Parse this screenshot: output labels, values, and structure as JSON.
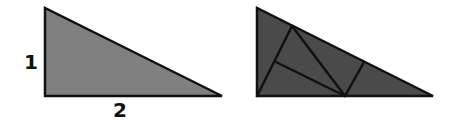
{
  "diagram": {
    "left_triangle": {
      "fill": "#808080",
      "stroke": "#111111",
      "points": [
        [
          45,
          8
        ],
        [
          45,
          96
        ],
        [
          222,
          96
        ]
      ],
      "labels": {
        "height": "1",
        "base": "2"
      }
    },
    "right_triangle": {
      "fill": "#4a4a4a",
      "stroke": "#111111",
      "points": [
        [
          257,
          8
        ],
        [
          257,
          96
        ],
        [
          433,
          96
        ]
      ],
      "dissection_lines": [
        [
          [
            257,
            96
          ],
          [
            292,
            26
          ]
        ],
        [
          [
            292,
            26
          ],
          [
            345,
            96
          ]
        ],
        [
          [
            276,
            62
          ],
          [
            345,
            96
          ]
        ],
        [
          [
            345,
            96
          ],
          [
            364,
            62
          ]
        ]
      ]
    }
  }
}
